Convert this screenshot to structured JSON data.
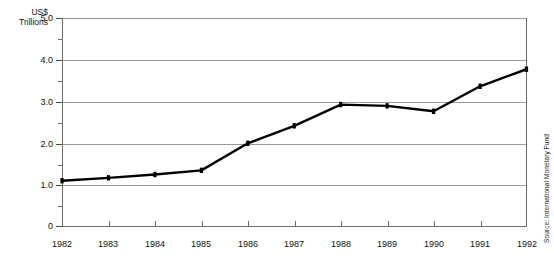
{
  "chart_data": {
    "type": "line",
    "title": "Japan's Gross National Product (GNP)",
    "xlabel": "",
    "ylabel": "US$ Trillions",
    "ylabel_line1": "US$",
    "ylabel_line2": "Trillions",
    "categories": [
      "1982",
      "1983",
      "1984",
      "1985",
      "1986",
      "1987",
      "1988",
      "1989",
      "1990",
      "1991",
      "1992"
    ],
    "values": [
      1.1,
      1.17,
      1.25,
      1.35,
      2.0,
      2.42,
      2.93,
      2.9,
      2.77,
      3.37,
      3.78
    ],
    "series": [
      {
        "name": "Japan GNP",
        "values": [
          1.1,
          1.17,
          1.25,
          1.35,
          2.0,
          2.42,
          2.93,
          2.9,
          2.77,
          3.37,
          3.78
        ]
      }
    ],
    "ylim": [
      0,
      5.0
    ],
    "ytick_major": [
      "0",
      "1.0",
      "2.0",
      "3.0",
      "4.0",
      "5.0"
    ],
    "ytick_major_values": [
      0,
      1.0,
      2.0,
      3.0,
      4.0,
      5.0
    ],
    "ytick_minor_values": [
      0.5,
      1.5,
      2.5,
      3.5,
      4.5
    ],
    "grid": true,
    "grid_axis": "y",
    "legend": false,
    "legend_position": "none",
    "line_color": "#000000",
    "marker": "square",
    "marker_color": "#000000",
    "grid_color": "#9a9a9a",
    "axis_color": "#6e6e6e",
    "background": "#ffffff",
    "source": "Source: International Monetary Fund"
  }
}
